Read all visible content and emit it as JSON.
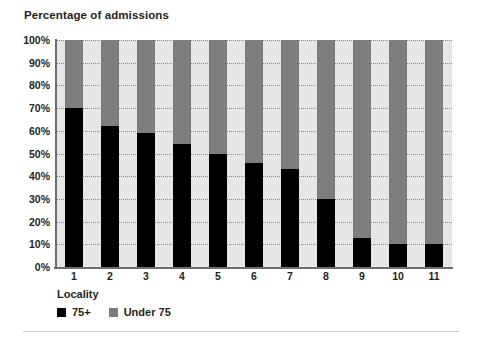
{
  "chart_data": {
    "type": "bar",
    "subtype": "stacked-percentage",
    "title": "Percentage of admissions",
    "xlabel": "Locality",
    "ylabel": "",
    "categories": [
      "1",
      "2",
      "3",
      "4",
      "5",
      "6",
      "7",
      "8",
      "9",
      "10",
      "11"
    ],
    "series": [
      {
        "name": "75+",
        "color": "#000000",
        "values": [
          70,
          62,
          59,
          54,
          50,
          46,
          43,
          30,
          13,
          10,
          10
        ]
      },
      {
        "name": "Under 75",
        "color": "#7d7d7d",
        "values": [
          30,
          38,
          41,
          46,
          50,
          54,
          57,
          70,
          87,
          90,
          90
        ]
      }
    ],
    "ylim": [
      0,
      100
    ],
    "ytick_labels": [
      "100%",
      "90%",
      "80%",
      "70%",
      "60%",
      "50%",
      "40%",
      "30%",
      "20%",
      "10%",
      "0%"
    ],
    "ytick_values": [
      100,
      90,
      80,
      70,
      60,
      50,
      40,
      30,
      20,
      10,
      0
    ],
    "grid": true,
    "legend_position": "bottom-left",
    "plot_background": "#e6e6e6"
  },
  "legend": {
    "title": "Locality",
    "entries": [
      {
        "label": "75+",
        "color": "#000000"
      },
      {
        "label": "Under 75",
        "color": "#7d7d7d"
      }
    ]
  }
}
